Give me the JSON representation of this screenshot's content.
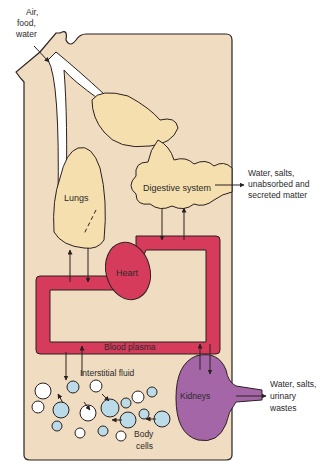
{
  "diagram": {
    "colors": {
      "body": "#f0dcc0",
      "organ": "#f6dfae",
      "circulation": "#d63b5c",
      "kidney": "#a566a8",
      "cell_blue": "#bcdbe8",
      "cell_white": "#ffffff",
      "outline": "#2a2020"
    },
    "labels": {
      "intake": [
        "Air,",
        "food,",
        "water"
      ],
      "lungs": "Lungs",
      "digestive": "Digestive system",
      "digestive_output": [
        "Water, salts,",
        "unabsorbed and",
        "secreted matter"
      ],
      "heart": "Heart",
      "blood_plasma": "Blood plasma",
      "interstitial_fluid": "Interstitial fluid",
      "kidneys": "Kidneys",
      "kidney_output": [
        "Water, salts,",
        "urinary",
        "wastes"
      ],
      "body_cells": [
        "Body",
        "cells"
      ]
    }
  }
}
